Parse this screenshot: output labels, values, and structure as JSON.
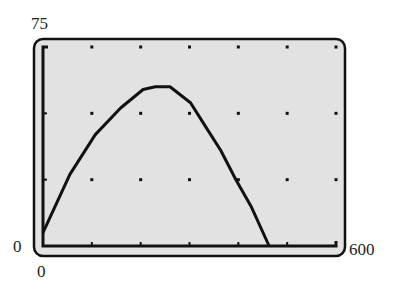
{
  "window": {
    "ymin_label": "0",
    "ymax_label": "75",
    "xmin_label": "0",
    "xmax_label": "600"
  },
  "colors": {
    "screen_bg": "#e2e2e2",
    "frame": "#111111",
    "curve": "#111111",
    "label": "#222222"
  },
  "chart_data": {
    "type": "line",
    "title": "",
    "xlabel": "",
    "ylabel": "",
    "xlim": [
      0,
      600
    ],
    "ylim": [
      0,
      75
    ],
    "x_tick_step": 100,
    "y_tick_step": 25,
    "grid": "dots",
    "legend": "none",
    "series": [
      {
        "name": "parabola",
        "x": [
          0,
          55,
          107,
          159,
          205,
          230,
          260,
          302,
          333,
          364,
          395,
          426,
          463
        ],
        "y": [
          5,
          27,
          42,
          52,
          59,
          60,
          60,
          54,
          45,
          36,
          25,
          15,
          0
        ]
      }
    ],
    "peak": {
      "x": 232,
      "y": 60
    },
    "x_intercepts": [
      0,
      463
    ]
  }
}
